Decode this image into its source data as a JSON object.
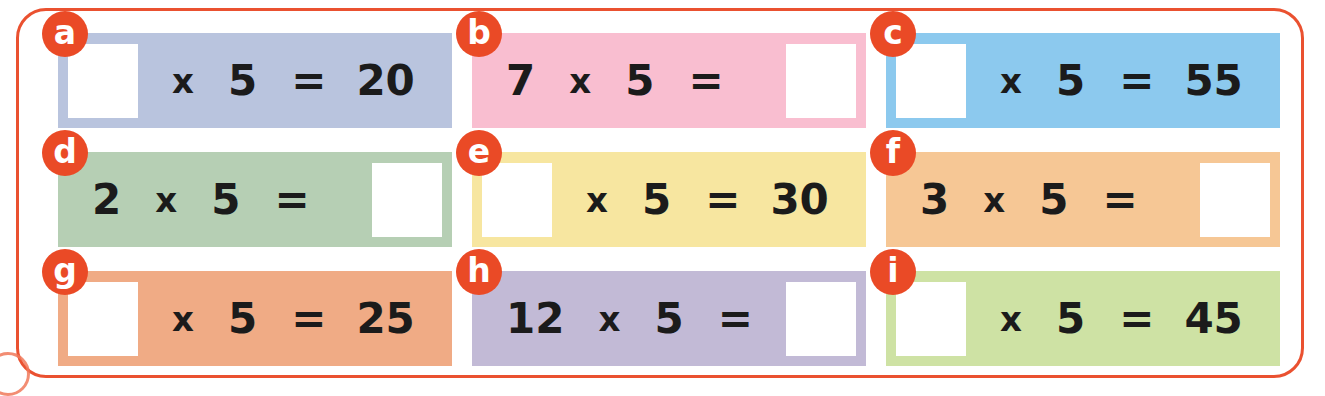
{
  "page": {
    "frame_color": "#ea5130",
    "badge_color": "#ea4a26",
    "badge_text_color": "#ffffff",
    "equation_text_color": "#1b1b1b",
    "answer_box_color": "#ffffff",
    "page_background": "#ffffff"
  },
  "problems": [
    {
      "id": "a",
      "label": "a",
      "bg": "#b9c4de",
      "left": 58,
      "top": 33,
      "width": 394,
      "height": 95,
      "blank_position": "left",
      "operand_a": "",
      "operator": "x",
      "operand_b": "5",
      "equals": "=",
      "result": "20",
      "answer": "4"
    },
    {
      "id": "b",
      "label": "b",
      "bg": "#f9bed0",
      "left": 472,
      "top": 33,
      "width": 394,
      "height": 95,
      "blank_position": "right",
      "operand_a": "7",
      "operator": "x",
      "operand_b": "5",
      "equals": "=",
      "result": "",
      "answer": "35"
    },
    {
      "id": "c",
      "label": "c",
      "bg": "#8cc9ee",
      "left": 886,
      "top": 33,
      "width": 394,
      "height": 95,
      "blank_position": "left",
      "operand_a": "",
      "operator": "x",
      "operand_b": "5",
      "equals": "=",
      "result": "55",
      "answer": "11"
    },
    {
      "id": "d",
      "label": "d",
      "bg": "#b6cfb4",
      "left": 58,
      "top": 152,
      "width": 394,
      "height": 95,
      "blank_position": "right",
      "operand_a": "2",
      "operator": "x",
      "operand_b": "5",
      "equals": "=",
      "result": "",
      "answer": "10"
    },
    {
      "id": "e",
      "label": "e",
      "bg": "#f7e6a0",
      "left": 472,
      "top": 152,
      "width": 394,
      "height": 95,
      "blank_position": "left",
      "operand_a": "",
      "operator": "x",
      "operand_b": "5",
      "equals": "=",
      "result": "30",
      "answer": "6"
    },
    {
      "id": "f",
      "label": "f",
      "bg": "#f6c795",
      "left": 886,
      "top": 152,
      "width": 394,
      "height": 95,
      "blank_position": "right",
      "operand_a": "3",
      "operator": "x",
      "operand_b": "5",
      "equals": "=",
      "result": "",
      "answer": "15"
    },
    {
      "id": "g",
      "label": "g",
      "bg": "#f0ab85",
      "left": 58,
      "top": 271,
      "width": 394,
      "height": 95,
      "blank_position": "left",
      "operand_a": "",
      "operator": "x",
      "operand_b": "5",
      "equals": "=",
      "result": "25",
      "answer": "5"
    },
    {
      "id": "h",
      "label": "h",
      "bg": "#c2bad6",
      "left": 472,
      "top": 271,
      "width": 394,
      "height": 95,
      "blank_position": "right",
      "operand_a": "12",
      "operator": "x",
      "operand_b": "5",
      "equals": "=",
      "result": "",
      "answer": "60"
    },
    {
      "id": "i",
      "label": "i",
      "bg": "#cee2a4",
      "left": 886,
      "top": 271,
      "width": 394,
      "height": 95,
      "blank_position": "left",
      "operand_a": "",
      "operator": "x",
      "operand_b": "5",
      "equals": "=",
      "result": "45",
      "answer": "9"
    }
  ]
}
